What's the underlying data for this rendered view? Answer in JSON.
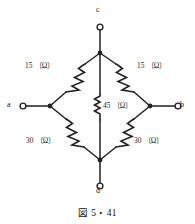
{
  "figure": {
    "caption": "図 5・41",
    "type": "electrical-circuit-diagram",
    "line_color": "#222222",
    "background_color": "#ffffff"
  },
  "terminals": [
    {
      "id": "c",
      "label": "c",
      "position": "top"
    },
    {
      "id": "a",
      "label": "a",
      "position": "left"
    },
    {
      "id": "b",
      "label": "b",
      "position": "right"
    },
    {
      "id": "d",
      "label": "d",
      "position": "bottom"
    }
  ],
  "resistors": [
    {
      "id": "top-left",
      "label": "15 〔Ω〕",
      "value": 15,
      "unit": "Ω",
      "branch": "c-a"
    },
    {
      "id": "top-right",
      "label": "15 〔Ω〕",
      "value": 15,
      "unit": "Ω",
      "branch": "c-b"
    },
    {
      "id": "center",
      "label": "45 〔Ω〕",
      "value": 45,
      "unit": "Ω",
      "branch": "c-d"
    },
    {
      "id": "bot-left",
      "label": "30 〔Ω〕",
      "value": 30,
      "unit": "Ω",
      "branch": "a-d"
    },
    {
      "id": "bot-right",
      "label": "30 〔Ω〕",
      "value": 30,
      "unit": "Ω",
      "branch": "b-d"
    }
  ]
}
